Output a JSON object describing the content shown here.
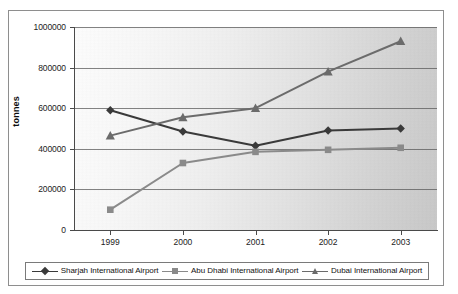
{
  "chart_data": {
    "type": "line",
    "title": "",
    "xlabel": "",
    "ylabel": "tonnes",
    "categories": [
      "1999",
      "2000",
      "2001",
      "2002",
      "2003"
    ],
    "ylim": [
      0,
      1000000
    ],
    "yticks": [
      0,
      200000,
      400000,
      600000,
      800000,
      1000000
    ],
    "ytick_labels": [
      "0",
      "200000",
      "400000",
      "600000",
      "800000",
      "1000000"
    ],
    "grid": true,
    "legend_position": "bottom",
    "series": [
      {
        "name": "Sharjah International Airport",
        "marker": "diamond",
        "color": "#3a3a3a",
        "values": [
          590000,
          485000,
          415000,
          490000,
          500000
        ]
      },
      {
        "name": "Abu Dhabi International Airport",
        "marker": "square",
        "color": "#8a8a8a",
        "values": [
          100000,
          330000,
          385000,
          395000,
          405000
        ]
      },
      {
        "name": "Dubai International Airport",
        "marker": "triangle",
        "color": "#6b6b6b",
        "values": [
          465000,
          555000,
          600000,
          780000,
          930000
        ]
      }
    ]
  },
  "axis": {
    "y_title": "tonnes",
    "y_tick_0": "0",
    "y_tick_1": "200000",
    "y_tick_2": "400000",
    "y_tick_3": "600000",
    "y_tick_4": "800000",
    "y_tick_5": "1000000",
    "x_tick_0": "1999",
    "x_tick_1": "2000",
    "x_tick_2": "2001",
    "x_tick_3": "2002",
    "x_tick_4": "2003"
  },
  "legend": {
    "entries": [
      {
        "label": "Sharjah International Airport",
        "marker": "diamond",
        "color": "#3a3a3a"
      },
      {
        "label": "Abu Dhabi International Airport",
        "marker": "square",
        "color": "#8a8a8a"
      },
      {
        "label": "Dubai International Airport",
        "marker": "triangle",
        "color": "#6b6b6b"
      }
    ]
  },
  "colors": {
    "sharjah": "#3a3a3a",
    "abu_dhabi": "#8a8a8a",
    "dubai": "#6b6b6b",
    "axis": "#4a4a4a",
    "grid": "#5a5a5a",
    "frame": "#8e8e8e"
  }
}
